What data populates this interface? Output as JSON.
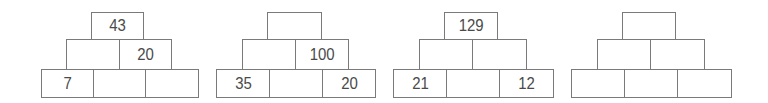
{
  "pyramids": [
    {
      "top": [
        {
          "value": "43",
          "x": 91,
          "y": 12,
          "w": 53,
          "h": 28
        }
      ],
      "middle": [
        {
          "value": "",
          "x": 66,
          "y": 39,
          "w": 54,
          "h": 31
        },
        {
          "value": "20",
          "x": 119,
          "y": 39,
          "w": 53,
          "h": 31
        }
      ],
      "bottom": [
        {
          "value": "7",
          "x": 41,
          "y": 69,
          "w": 53,
          "h": 29
        },
        {
          "value": "",
          "x": 93,
          "y": 69,
          "w": 53,
          "h": 29
        },
        {
          "value": "",
          "x": 145,
          "y": 69,
          "w": 54,
          "h": 29
        }
      ]
    },
    {
      "top": [
        {
          "value": "",
          "x": 267,
          "y": 12,
          "w": 55,
          "h": 28
        }
      ],
      "middle": [
        {
          "value": "",
          "x": 242,
          "y": 39,
          "w": 54,
          "h": 31
        },
        {
          "value": "100",
          "x": 295,
          "y": 39,
          "w": 54,
          "h": 31
        }
      ],
      "bottom": [
        {
          "value": "35",
          "x": 216,
          "y": 69,
          "w": 54,
          "h": 29
        },
        {
          "value": "",
          "x": 269,
          "y": 69,
          "w": 54,
          "h": 29
        },
        {
          "value": "20",
          "x": 322,
          "y": 69,
          "w": 54,
          "h": 29
        }
      ]
    },
    {
      "top": [
        {
          "value": "129",
          "x": 444,
          "y": 12,
          "w": 54,
          "h": 28
        }
      ],
      "middle": [
        {
          "value": "",
          "x": 419,
          "y": 39,
          "w": 54,
          "h": 31
        },
        {
          "value": "",
          "x": 472,
          "y": 39,
          "w": 55,
          "h": 31
        }
      ],
      "bottom": [
        {
          "value": "21",
          "x": 393,
          "y": 69,
          "w": 54,
          "h": 29
        },
        {
          "value": "",
          "x": 446,
          "y": 69,
          "w": 54,
          "h": 29
        },
        {
          "value": "12",
          "x": 499,
          "y": 69,
          "w": 55,
          "h": 29
        }
      ]
    },
    {
      "top": [
        {
          "value": "",
          "x": 622,
          "y": 12,
          "w": 54,
          "h": 28
        }
      ],
      "middle": [
        {
          "value": "",
          "x": 597,
          "y": 39,
          "w": 54,
          "h": 31
        },
        {
          "value": "",
          "x": 650,
          "y": 39,
          "w": 55,
          "h": 31
        }
      ],
      "bottom": [
        {
          "value": "",
          "x": 571,
          "y": 69,
          "w": 54,
          "h": 29
        },
        {
          "value": "",
          "x": 624,
          "y": 69,
          "w": 54,
          "h": 29
        },
        {
          "value": "",
          "x": 677,
          "y": 69,
          "w": 55,
          "h": 29
        }
      ]
    }
  ]
}
